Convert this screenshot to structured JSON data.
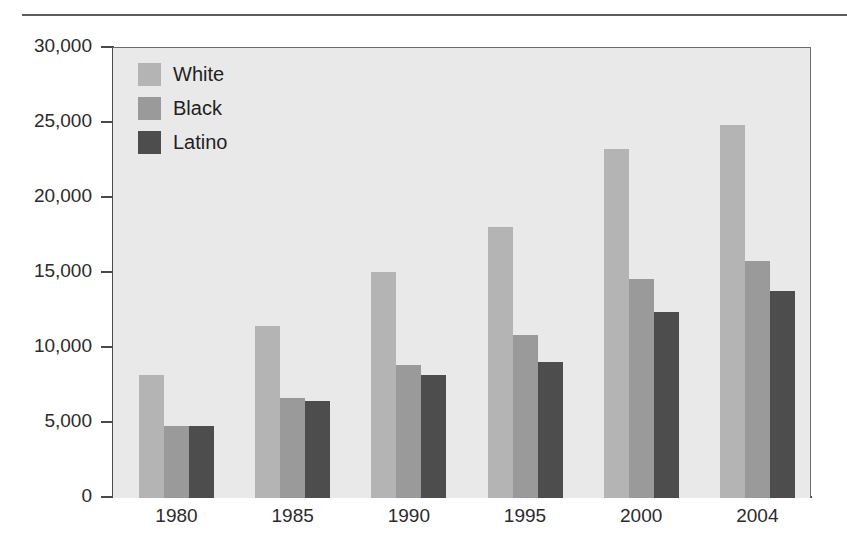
{
  "chart_data": {
    "type": "bar",
    "title": "",
    "subtitle": "",
    "xlabel": "",
    "ylabel": "",
    "categories": [
      "1980",
      "1985",
      "1990",
      "1995",
      "2000",
      "2004"
    ],
    "series": [
      {
        "name": "White",
        "color": "#b4b4b4",
        "values": [
          8200,
          11500,
          15100,
          18100,
          23300,
          24900
        ]
      },
      {
        "name": "Black",
        "color": "#9a9a9a",
        "values": [
          4800,
          6700,
          8900,
          10900,
          14600,
          15800
        ]
      },
      {
        "name": "Latino",
        "color": "#4d4d4d",
        "values": [
          4800,
          6500,
          8200,
          9100,
          12400,
          13800
        ]
      }
    ],
    "ylim": [
      0,
      30000
    ],
    "yticks": [
      0,
      5000,
      10000,
      15000,
      20000,
      25000,
      30000
    ],
    "ytick_labels": [
      "0",
      "5,000",
      "10,000",
      "15,000",
      "20,000",
      "25,000",
      "30,000"
    ],
    "grid": false,
    "legend_position": "top-left",
    "plot_background": "#e9e9e9",
    "axis_color": "#4a4a4a"
  },
  "legend": {
    "entries": [
      {
        "label": "White"
      },
      {
        "label": "Black"
      },
      {
        "label": "Latino"
      }
    ]
  }
}
